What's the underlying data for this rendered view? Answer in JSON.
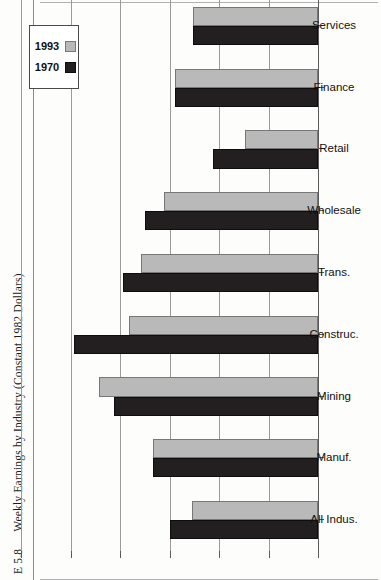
{
  "caption": {
    "number": "E 5.8",
    "text": "Weekly Earnings by Industry (Constant 1982 Dollars)"
  },
  "legend": {
    "items": [
      {
        "label": "1970",
        "color": "#231f20"
      },
      {
        "label": "1993",
        "color": "#b9b9b9"
      }
    ]
  },
  "axis": {
    "tick_labels": [
      "$600",
      "$500",
      "$400",
      "$300",
      "$200",
      "$100",
      "$0"
    ]
  },
  "chart_data": {
    "type": "bar",
    "orientation": "horizontal",
    "title": "Weekly Earnings by Industry (Constant 1982 Dollars)",
    "xlabel": "",
    "ylabel": "",
    "value_axis_ticks": [
      0,
      100,
      200,
      300,
      400,
      500,
      600
    ],
    "value_axis_tick_labels": [
      "$0",
      "$100",
      "$200",
      "$300",
      "$400",
      "$500",
      "$600"
    ],
    "vlim": [
      0,
      600
    ],
    "grid": true,
    "legend_position": "top-right",
    "categories": [
      "All Indus.",
      "Manuf.",
      "Mining",
      "Construc.",
      "Trans.",
      "Wholesale",
      "Retail",
      "Finance",
      "Services"
    ],
    "series": [
      {
        "name": "1970",
        "color": "#231f20",
        "values": [
          300,
          333,
          413,
          493,
          394,
          350,
          212,
          289,
          253
        ]
      },
      {
        "name": "1993",
        "color": "#b9b9b9",
        "values": [
          255,
          333,
          442,
          382,
          358,
          311,
          147,
          289,
          253
        ]
      }
    ]
  }
}
